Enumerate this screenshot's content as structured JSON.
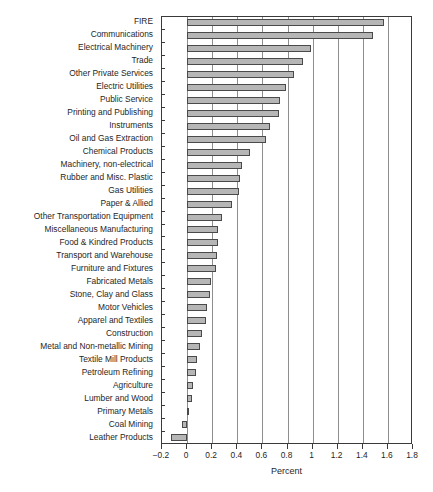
{
  "chart_data": {
    "type": "bar",
    "orientation": "horizontal",
    "title": "",
    "xlabel": "Percent",
    "ylabel": "",
    "xlim": [
      -0.2,
      1.8
    ],
    "xticks": [
      "-0.2",
      "0",
      "0.2",
      "0.4",
      "0.6",
      "0.8",
      "1",
      "1.2",
      "1.4",
      "1.6",
      "1.8"
    ],
    "xtick_values": [
      -0.2,
      0,
      0.2,
      0.4,
      0.6,
      0.8,
      1.0,
      1.2,
      1.4,
      1.6,
      1.8
    ],
    "grid": true,
    "grid_axis": "x",
    "legend": "none",
    "bar_fill": "#b6b6b6",
    "bar_edge": "#4a4a4a",
    "categories": [
      "FIRE",
      "Communications",
      "Electrical Machinery",
      "Trade",
      "Other Private Services",
      "Electric Utilities",
      "Public Service",
      "Printing and Publishing",
      "Instruments",
      "Oil and Gas Extraction",
      "Chemical Products",
      "Machinery, non-electrical",
      "Rubber and Misc. Plastic",
      "Gas Utilities",
      "Paper & Allied",
      "Other Transportation Equipment",
      "Miscellaneous Manufacturing",
      "Food & Kindred Products",
      "Transport and Warehouse",
      "Furniture and Fixtures",
      "Fabricated Metals",
      "Stone, Clay and Glass",
      "Motor Vehicles",
      "Apparel and Textiles",
      "Construction",
      "Metal and Non-metallic Mining",
      "Textile Mill Products",
      "Petroleum Refining",
      "Agriculture",
      "Lumber and Wood",
      "Primary Metals",
      "Coal Mining",
      "Leather Products"
    ],
    "values": [
      1.57,
      1.48,
      0.99,
      0.92,
      0.85,
      0.79,
      0.74,
      0.73,
      0.66,
      0.63,
      0.5,
      0.44,
      0.42,
      0.41,
      0.36,
      0.28,
      0.25,
      0.25,
      0.24,
      0.23,
      0.19,
      0.18,
      0.16,
      0.15,
      0.12,
      0.1,
      0.08,
      0.07,
      0.05,
      0.04,
      0.01,
      -0.04,
      -0.13
    ]
  }
}
